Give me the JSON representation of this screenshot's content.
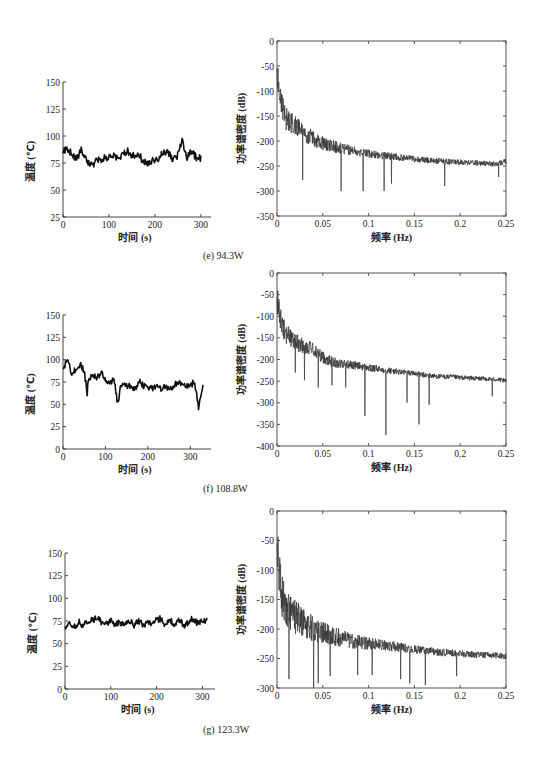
{
  "chart_data": [
    {
      "panel": "e",
      "caption": "(e) 94.3W",
      "charts": [
        {
          "type": "line",
          "title": "",
          "xlabel": "时间 (s)",
          "ylabel": "温度 (℃)",
          "xlim": [
            0,
            300
          ],
          "ylim": [
            25,
            150
          ],
          "xticks": [
            0,
            100,
            200,
            300
          ],
          "yticks": [
            25,
            50,
            75,
            100,
            125,
            150
          ],
          "grid": false,
          "series": [
            {
              "name": "temperature",
              "x": [
                0,
                10,
                20,
                30,
                40,
                50,
                60,
                70,
                80,
                90,
                100,
                110,
                120,
                130,
                140,
                150,
                160,
                170,
                180,
                190,
                200,
                210,
                220,
                230,
                240,
                250,
                260,
                270,
                280,
                290,
                300
              ],
              "values": [
                86,
                88,
                84,
                78,
                88,
                80,
                72,
                76,
                78,
                80,
                80,
                82,
                80,
                82,
                86,
                82,
                82,
                80,
                74,
                76,
                78,
                80,
                86,
                84,
                78,
                82,
                96,
                80,
                86,
                80,
                80
              ]
            }
          ]
        },
        {
          "type": "line",
          "title": "",
          "xlabel": "频率 (Hz)",
          "ylabel": "功率谱密度 (dB)",
          "xlim": [
            0,
            0.25
          ],
          "ylim": [
            -350,
            0
          ],
          "xticks": [
            0,
            0.05,
            0.1,
            0.15,
            0.2,
            0.25
          ],
          "yticks": [
            0,
            -50,
            -100,
            -150,
            -200,
            -250,
            -300,
            -350
          ],
          "grid": false,
          "series": [
            {
              "name": "PSD",
              "x": [
                0,
                0.005,
                0.01,
                0.02,
                0.03,
                0.04,
                0.05,
                0.06,
                0.07,
                0.08,
                0.09,
                0.1,
                0.11,
                0.12,
                0.13,
                0.14,
                0.15,
                0.16,
                0.17,
                0.18,
                0.19,
                0.2,
                0.21,
                0.22,
                0.23,
                0.24,
                0.25
              ],
              "values": [
                -60,
                -130,
                -155,
                -170,
                -185,
                -195,
                -205,
                -210,
                -215,
                -218,
                -222,
                -225,
                -228,
                -230,
                -232,
                -234,
                -236,
                -238,
                -240,
                -240,
                -242,
                -242,
                -243,
                -244,
                -245,
                -246,
                -240
              ]
            }
          ],
          "annotations": [
            "deep notches near 0.028, 0.07, 0.094, 0.117 Hz reaching about -300 dB"
          ]
        }
      ]
    },
    {
      "panel": "f",
      "caption": "(f) 108.8W",
      "charts": [
        {
          "type": "line",
          "xlabel": "时间 (s)",
          "ylabel": "温度 (℃)",
          "xlim": [
            0,
            330
          ],
          "ylim": [
            0,
            150
          ],
          "xticks": [
            0,
            100,
            200,
            300
          ],
          "yticks": [
            0,
            25,
            50,
            75,
            100,
            125,
            150
          ],
          "grid": false,
          "series": [
            {
              "name": "temperature",
              "x": [
                0,
                10,
                20,
                30,
                40,
                50,
                57,
                60,
                70,
                80,
                90,
                100,
                110,
                120,
                130,
                135,
                140,
                150,
                160,
                170,
                180,
                190,
                200,
                210,
                220,
                230,
                240,
                250,
                260,
                270,
                280,
                290,
                300,
                310,
                320,
                325,
                330
              ],
              "values": [
                90,
                100,
                85,
                88,
                95,
                88,
                62,
                78,
                82,
                80,
                85,
                78,
                72,
                78,
                48,
                70,
                72,
                70,
                70,
                68,
                76,
                70,
                70,
                68,
                70,
                68,
                70,
                68,
                70,
                75,
                72,
                70,
                70,
                76,
                46,
                60,
                70
              ]
            }
          ]
        },
        {
          "type": "line",
          "xlabel": "频率 (Hz)",
          "ylabel": "功率谱密度 (dB)",
          "xlim": [
            0,
            0.25
          ],
          "ylim": [
            -400,
            0
          ],
          "xticks": [
            0,
            0.05,
            0.1,
            0.15,
            0.2,
            0.25
          ],
          "yticks": [
            0,
            -50,
            -100,
            -150,
            -200,
            -250,
            -300,
            -350,
            -400
          ],
          "grid": false,
          "series": [
            {
              "name": "PSD",
              "x": [
                0,
                0.005,
                0.01,
                0.02,
                0.03,
                0.04,
                0.05,
                0.06,
                0.07,
                0.08,
                0.09,
                0.1,
                0.11,
                0.12,
                0.13,
                0.14,
                0.15,
                0.16,
                0.17,
                0.18,
                0.19,
                0.2,
                0.21,
                0.22,
                0.23,
                0.24,
                0.25
              ],
              "values": [
                -55,
                -120,
                -140,
                -160,
                -170,
                -178,
                -195,
                -205,
                -210,
                -212,
                -215,
                -220,
                -222,
                -225,
                -228,
                -230,
                -232,
                -236,
                -238,
                -240,
                -240,
                -242,
                -243,
                -244,
                -245,
                -246,
                -250
              ]
            }
          ],
          "annotations": [
            "deep notches near 0.096 Hz (-330 dB), 0.119 Hz (-375 dB), 0.155 Hz (-350 dB)"
          ]
        }
      ]
    },
    {
      "panel": "g",
      "caption": "(g) 123.3W",
      "charts": [
        {
          "type": "line",
          "xlabel": "时间 (s)",
          "ylabel": "温度 (℃)",
          "xlim": [
            0,
            310
          ],
          "ylim": [
            0,
            150
          ],
          "xticks": [
            0,
            100,
            200,
            300
          ],
          "yticks": [
            0,
            25,
            50,
            75,
            100,
            125,
            150
          ],
          "grid": false,
          "series": [
            {
              "name": "temperature",
              "x": [
                0,
                10,
                20,
                30,
                40,
                50,
                60,
                70,
                80,
                90,
                100,
                110,
                120,
                130,
                140,
                150,
                160,
                170,
                180,
                190,
                200,
                210,
                220,
                230,
                240,
                250,
                260,
                270,
                280,
                290,
                300,
                310
              ],
              "values": [
                68,
                74,
                68,
                74,
                70,
                74,
                76,
                78,
                74,
                72,
                76,
                70,
                74,
                70,
                76,
                70,
                76,
                70,
                74,
                72,
                76,
                78,
                70,
                76,
                70,
                76,
                70,
                74,
                78,
                72,
                76,
                76
              ]
            }
          ]
        },
        {
          "type": "line",
          "xlabel": "频率 (Hz)",
          "ylabel": "功率谱密度 (dB)",
          "xlim": [
            0,
            0.25
          ],
          "ylim": [
            -300,
            0
          ],
          "xticks": [
            0,
            0.05,
            0.1,
            0.15,
            0.2,
            0.25
          ],
          "yticks": [
            0,
            -50,
            -100,
            -150,
            -200,
            -250,
            -300
          ],
          "grid": false,
          "series": [
            {
              "name": "PSD",
              "x": [
                0,
                0.005,
                0.01,
                0.02,
                0.03,
                0.04,
                0.05,
                0.06,
                0.07,
                0.08,
                0.09,
                0.1,
                0.11,
                0.12,
                0.13,
                0.14,
                0.15,
                0.16,
                0.17,
                0.18,
                0.19,
                0.2,
                0.21,
                0.22,
                0.23,
                0.24,
                0.25
              ],
              "values": [
                -60,
                -140,
                -165,
                -180,
                -190,
                -200,
                -205,
                -212,
                -215,
                -220,
                -222,
                -225,
                -226,
                -228,
                -230,
                -232,
                -234,
                -236,
                -238,
                -240,
                -240,
                -242,
                -243,
                -244,
                -244,
                -245,
                -245
              ]
            }
          ],
          "annotations": [
            "dense broadband fluctuation; notches reach about -290 dB near 0.04, 0.145, 0.162 Hz"
          ]
        }
      ]
    }
  ]
}
